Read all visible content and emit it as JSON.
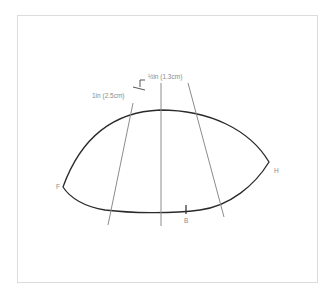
{
  "diagram": {
    "labels": {
      "half_inch": "½in (1.3cm)",
      "one_inch": "1in (2.5cm)",
      "point_f": "F",
      "point_h": "H",
      "point_b": "B"
    },
    "colors": {
      "curve": "#2a2a2a",
      "guide_lines": "#8c8c8c",
      "frame": "#dcdcdc",
      "text": "#8a8a8a"
    }
  }
}
